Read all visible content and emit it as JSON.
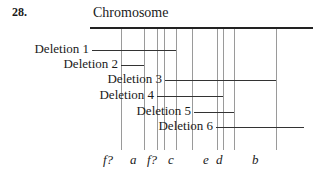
{
  "figure": {
    "number": "28.",
    "title": "Chromosome"
  },
  "deletions": [
    {
      "label": "Deletion 1",
      "label_right": 89,
      "y": 50,
      "x1": 92,
      "x2": 176
    },
    {
      "label": "Deletion 2",
      "label_right": 118,
      "y": 65,
      "x1": 121,
      "x2": 144
    },
    {
      "label": "Deletion 3",
      "label_right": 162,
      "y": 80,
      "x1": 165,
      "x2": 276
    },
    {
      "label": "Deletion 4",
      "label_right": 154,
      "y": 96,
      "x1": 157,
      "x2": 223
    },
    {
      "label": "Deletion 5",
      "label_right": 191,
      "y": 112,
      "x1": 194,
      "x2": 234
    },
    {
      "label": "Deletion 6",
      "label_right": 213,
      "y": 127,
      "x1": 216,
      "x2": 304
    }
  ],
  "marker_lines_x": [
    121,
    144,
    157,
    164,
    176,
    192,
    217,
    223,
    234,
    276
  ],
  "genes": [
    {
      "label": "f?",
      "x": 103
    },
    {
      "label": "a",
      "x": 130
    },
    {
      "label": "f?",
      "x": 147
    },
    {
      "label": "c",
      "x": 168
    },
    {
      "label": "e",
      "x": 203
    },
    {
      "label": "d",
      "x": 216
    },
    {
      "label": "b",
      "x": 252
    }
  ]
}
